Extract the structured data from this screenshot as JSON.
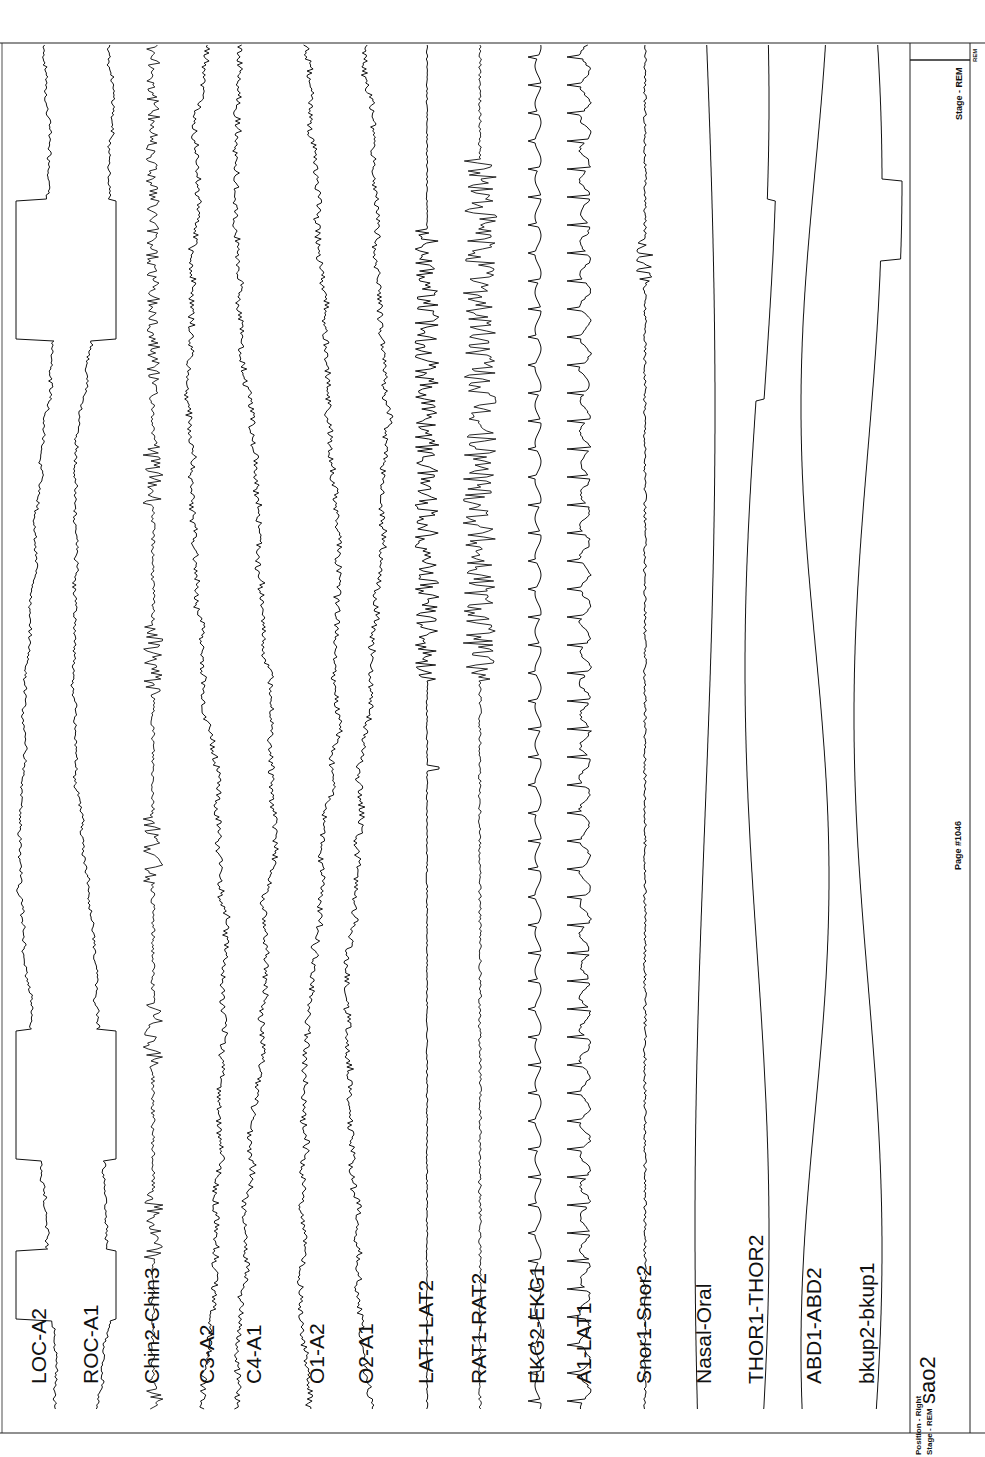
{
  "chart_data": {
    "type": "line",
    "orientation": "vertical traces, time runs bottom-to-top",
    "page_label": "Page #1046",
    "stage": "REM",
    "position": "Right",
    "channels": [
      {
        "label": "LOC-A2",
        "x": 40,
        "kind": "eog",
        "amp": 22
      },
      {
        "label": "ROC-A1",
        "x": 92,
        "kind": "eog",
        "amp": 22
      },
      {
        "label": "Chin2-Chin3",
        "x": 153,
        "kind": "emg",
        "amp": 10
      },
      {
        "label": "C3-A2",
        "x": 208,
        "kind": "eeg",
        "amp": 18
      },
      {
        "label": "C4-A1",
        "x": 255,
        "kind": "eeg",
        "amp": 18
      },
      {
        "label": "O1-A2",
        "x": 318,
        "kind": "eeg",
        "amp": 16
      },
      {
        "label": "O2-A1",
        "x": 367,
        "kind": "eeg",
        "amp": 16
      },
      {
        "label": "LAT1-LAT2",
        "x": 427,
        "kind": "lat",
        "amp": 14
      },
      {
        "label": "RAT1-RAT2",
        "x": 480,
        "kind": "rat",
        "amp": 28
      },
      {
        "label": "EKG2-EKG1",
        "x": 538,
        "kind": "ekg",
        "amp": 10
      },
      {
        "label": "A1-LAT1",
        "x": 585,
        "kind": "ekg2",
        "amp": 12
      },
      {
        "label": "Snor1-Snor2",
        "x": 645,
        "kind": "snore",
        "amp": 6
      },
      {
        "label": "Nasal-Oral",
        "x": 705,
        "kind": "resp",
        "amp": 10
      },
      {
        "label": "THOR1-THOR2",
        "x": 757,
        "kind": "resp2",
        "amp": 12
      },
      {
        "label": "ABD1-ABD2",
        "x": 815,
        "kind": "resp3",
        "amp": 14
      },
      {
        "label": "bkup2-bkup1",
        "x": 868,
        "kind": "resp4",
        "amp": 14
      },
      {
        "label": "sao2",
        "x": 912,
        "kind": "flat",
        "amp": 0
      }
    ],
    "ylim": [
      45,
      1410
    ],
    "grid": false,
    "legend": "channel labels drawn at bottom of each trace"
  },
  "footer": {
    "position_label": "Position - Right",
    "stage_label": "Stage - REM",
    "sao2_label": "sao2",
    "page_label": "Page #1046",
    "top_stage_label": "Stage - REM",
    "top_tiny_label": "REM"
  },
  "colors": {
    "ink": "#111111",
    "paper": "#ffffff"
  }
}
